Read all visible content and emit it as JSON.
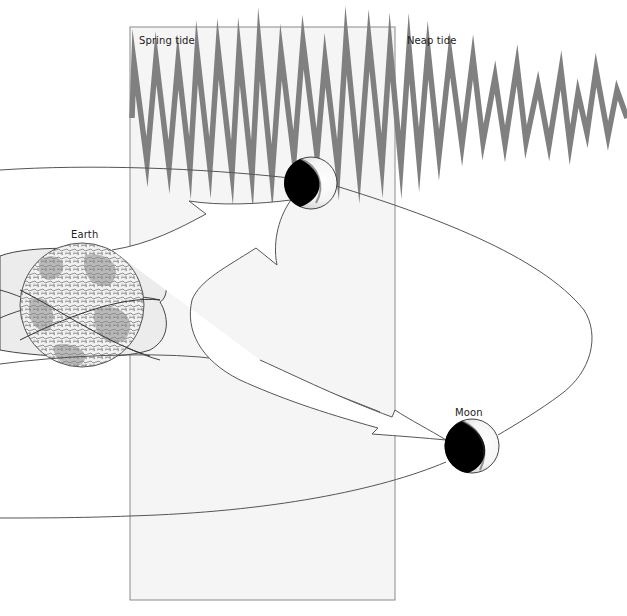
{
  "diagram": {
    "labels": {
      "spring_tide": "Spring tide",
      "neap_tide": "Neap tide",
      "earth": "Earth",
      "moon": "Moon"
    },
    "colors": {
      "tide_wave": "#808080",
      "panel_fill": "#f4f4f4",
      "panel_border": "#8a8a8a",
      "orbit_line": "#555555",
      "moon_dark": "#000000",
      "moon_light": "#ffffff",
      "bulge_fill": "#ececec"
    },
    "tide_wave": {
      "description": "Zig-zag tidal range curve: large amplitude (spring) on left decreasing to small amplitude (neap) on right",
      "points": [
        [
          132,
          118
        ],
        [
          134,
          62
        ],
        [
          147,
          162
        ],
        [
          156,
          58
        ],
        [
          169,
          167
        ],
        [
          178,
          62
        ],
        [
          190,
          168
        ],
        [
          197,
          52
        ],
        [
          210,
          168
        ],
        [
          218,
          49
        ],
        [
          232,
          173
        ],
        [
          239,
          51
        ],
        [
          252,
          175
        ],
        [
          259,
          44
        ],
        [
          272,
          177
        ],
        [
          281,
          52
        ],
        [
          294,
          158
        ],
        [
          303,
          42
        ],
        [
          317,
          155
        ],
        [
          325,
          60
        ],
        [
          338,
          170
        ],
        [
          346,
          40
        ],
        [
          359,
          172
        ],
        [
          369,
          40
        ],
        [
          382,
          166
        ],
        [
          390,
          47
        ],
        [
          401,
          165
        ],
        [
          409,
          48
        ],
        [
          419,
          160
        ],
        [
          428,
          50
        ],
        [
          439,
          155
        ],
        [
          450,
          55
        ],
        [
          462,
          145
        ],
        [
          473,
          57
        ],
        [
          483,
          142
        ],
        [
          495,
          77
        ],
        [
          505,
          144
        ],
        [
          517,
          65
        ],
        [
          526,
          142
        ],
        [
          538,
          85
        ],
        [
          549,
          145
        ],
        [
          561,
          70
        ],
        [
          570,
          145
        ],
        [
          578,
          93
        ],
        [
          587,
          133
        ],
        [
          596,
          70
        ],
        [
          608,
          136
        ],
        [
          617,
          90
        ],
        [
          627,
          118
        ]
      ]
    },
    "bodies": {
      "earth": {
        "cx": 82,
        "cy": 305,
        "r": 62
      },
      "moon_top": {
        "cx": 311,
        "cy": 183,
        "r": 26,
        "phase": "crescent-lit-right"
      },
      "moon_bottom": {
        "cx": 472,
        "cy": 446,
        "r": 27,
        "phase": "crescent-lit-right"
      }
    },
    "panel": {
      "x": 130,
      "y": 27,
      "width": 265,
      "height": 573
    }
  }
}
